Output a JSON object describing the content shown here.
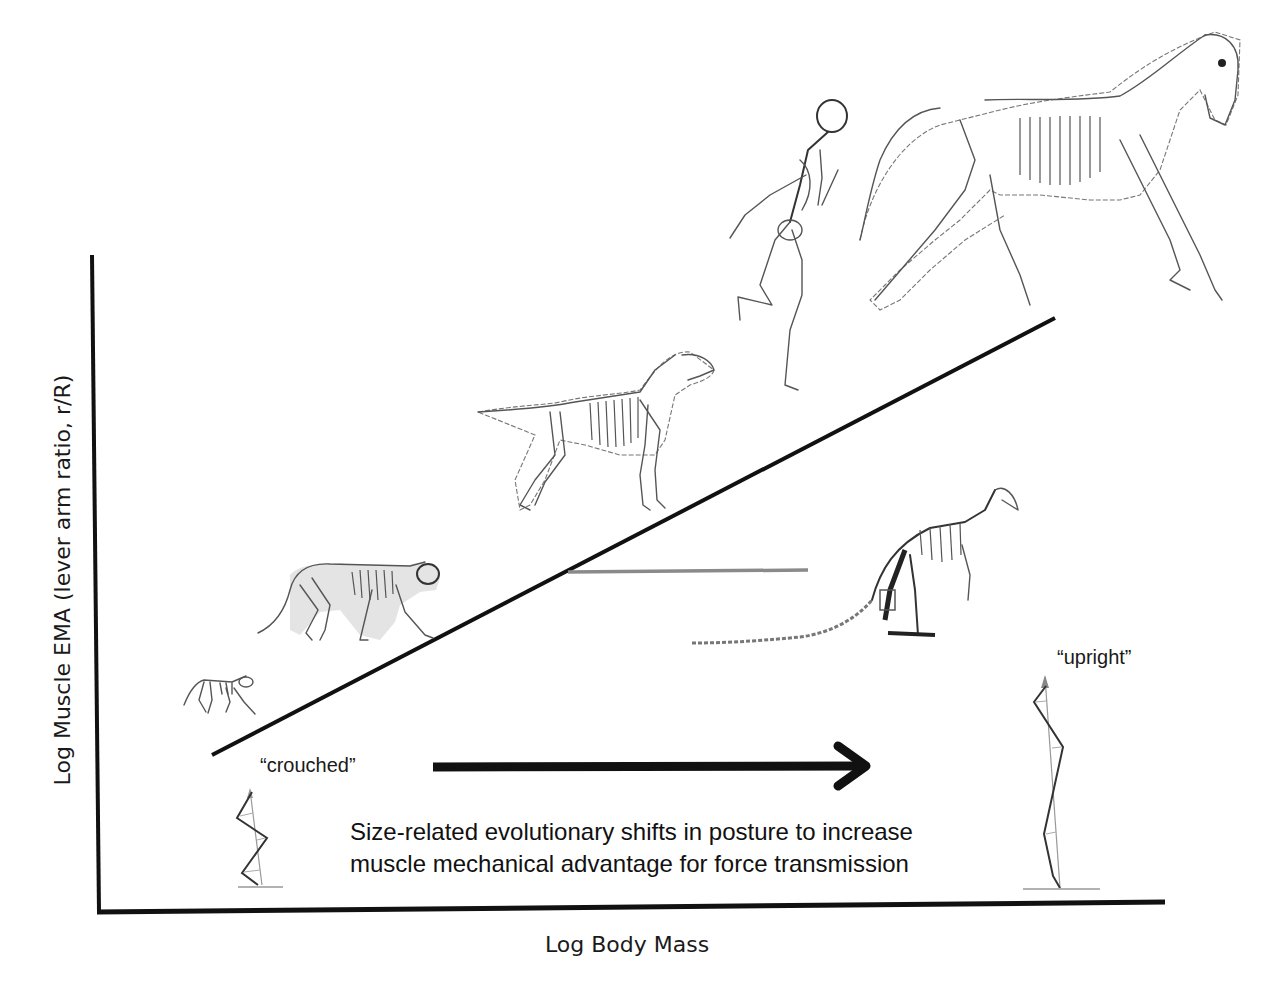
{
  "diagram": {
    "type": "conceptual-scaling-diagram",
    "y_axis": {
      "label": "Log Muscle EMA (lever arm ratio, r/R)"
    },
    "x_axis": {
      "label": "Log Body Mass"
    },
    "trend_line": {
      "description": "EMA increases with body mass",
      "from": [
        212,
        755
      ],
      "to": [
        1055,
        318
      ],
      "color": "#111111"
    },
    "reference_line": {
      "color": "#8a8a8a"
    },
    "arrow": {
      "direction": "right",
      "color": "#111111"
    },
    "postures": {
      "crouched": {
        "label": "“crouched”"
      },
      "upright": {
        "label": "“upright”"
      }
    },
    "caption": {
      "line1": "Size-related evolutionary shifts in posture to increase",
      "line2": "muscle mechanical advantage for force transmission"
    },
    "animals": [
      {
        "name": "small mammal (mouse/rat)",
        "order": 1
      },
      {
        "name": "cat",
        "order": 2
      },
      {
        "name": "dog",
        "order": 3
      },
      {
        "name": "human",
        "order": 4
      },
      {
        "name": "horse",
        "order": 5
      },
      {
        "name": "kangaroo",
        "note": "outlier below trend"
      }
    ]
  }
}
